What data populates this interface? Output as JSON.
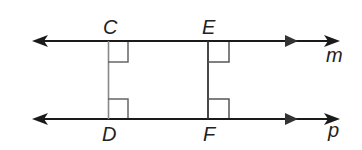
{
  "diagram": {
    "type": "parallel lines with perpendicular transversals",
    "lines": [
      {
        "name": "m",
        "label": "m"
      },
      {
        "name": "p",
        "label": "p"
      }
    ],
    "points": {
      "C": "C",
      "D": "D",
      "E": "E",
      "F": "F"
    },
    "segments": [
      "CD",
      "EF"
    ],
    "right_angles": [
      "C",
      "D",
      "E",
      "F"
    ],
    "colors": {
      "line": "#1a1a1a",
      "segment_cd": "#888888",
      "segment_ef": "#333333",
      "right_angle_mark": "#666666"
    }
  }
}
